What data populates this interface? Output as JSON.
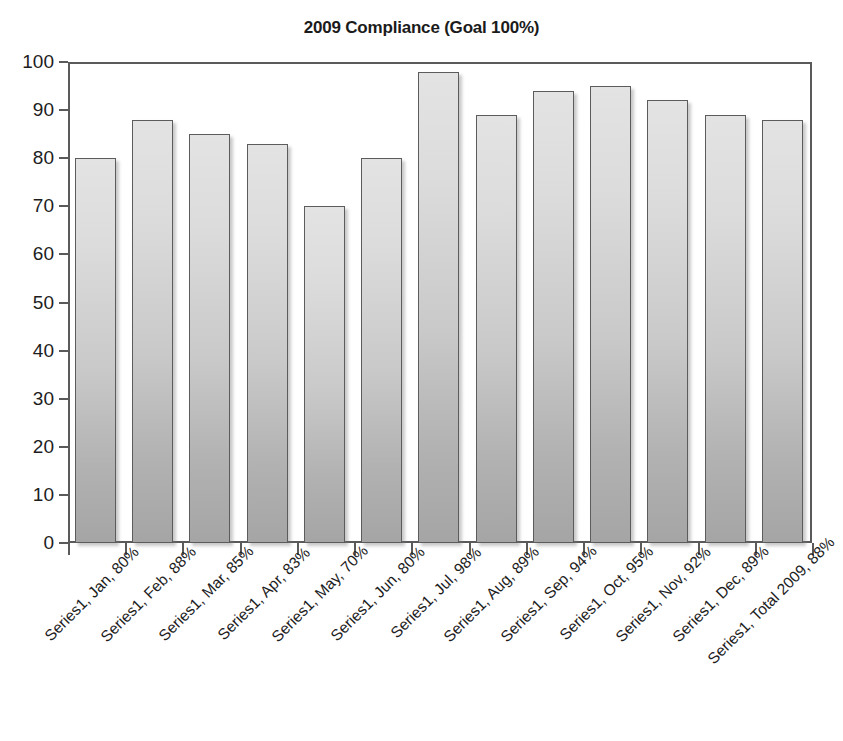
{
  "chart_data": {
    "type": "bar",
    "title": "2009 Compliance (Goal 100%)",
    "xlabel": "",
    "ylabel": "",
    "ylim": [
      0,
      100
    ],
    "ytick_step": 10,
    "grid": false,
    "legend": "none",
    "series_name": "Series1",
    "categories": [
      "Jan",
      "Feb",
      "Mar",
      "Apr",
      "May",
      "Jun",
      "Jul",
      "Aug",
      "Sep",
      "Oct",
      "Nov",
      "Dec",
      "Total 2009"
    ],
    "values": [
      80,
      88,
      85,
      83,
      70,
      80,
      98,
      89,
      94,
      95,
      92,
      89,
      88
    ],
    "ytick_labels": [
      "100",
      "90",
      "80",
      "70",
      "60",
      "50",
      "40",
      "30",
      "20",
      "10",
      "0"
    ],
    "ytick_values": [
      100,
      90,
      80,
      70,
      60,
      50,
      40,
      30,
      20,
      10,
      0
    ],
    "category_labels": [
      "Series1, Jan, 80%",
      "Series1, Feb, 88%",
      "Series1, Mar, 85%",
      "Series1, Apr, 83%",
      "Series1, May, 70%",
      "Series1, Jun, 80%",
      "Series1, Jul, 98%",
      "Series1, Aug, 89%",
      "Series1, Sep, 94%",
      "Series1, Oct, 95%",
      "Series1, Nov, 92%",
      "Series1, Dec, 89%",
      "Series1, Total 2009, 88%"
    ],
    "colors": {
      "bar_fill_top": "#e3e3e3",
      "bar_fill_bottom": "#a5a5a5",
      "bar_border": "#5c5c5c",
      "axis": "#5a5a5a",
      "text": "#1d1d1d",
      "background": "#ffffff"
    }
  }
}
